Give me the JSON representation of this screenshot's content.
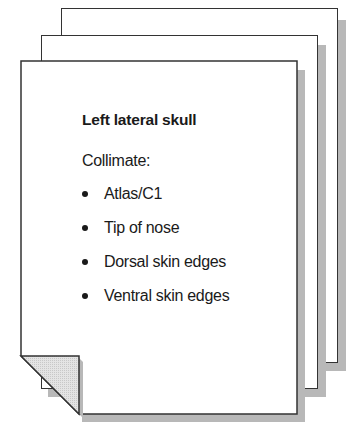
{
  "card": {
    "title": "Left lateral skull",
    "subtitle": "Collimate:",
    "items": [
      {
        "label": "Atlas/C1"
      },
      {
        "label": "Tip of nose"
      },
      {
        "label": "Dorsal skin edges"
      },
      {
        "label": "Ventral skin edges"
      }
    ]
  },
  "style": {
    "page_fill": "#ffffff",
    "page_border": "#333333",
    "shadow": "#b8b8b8",
    "fold_fill": "#d9d9d9"
  }
}
